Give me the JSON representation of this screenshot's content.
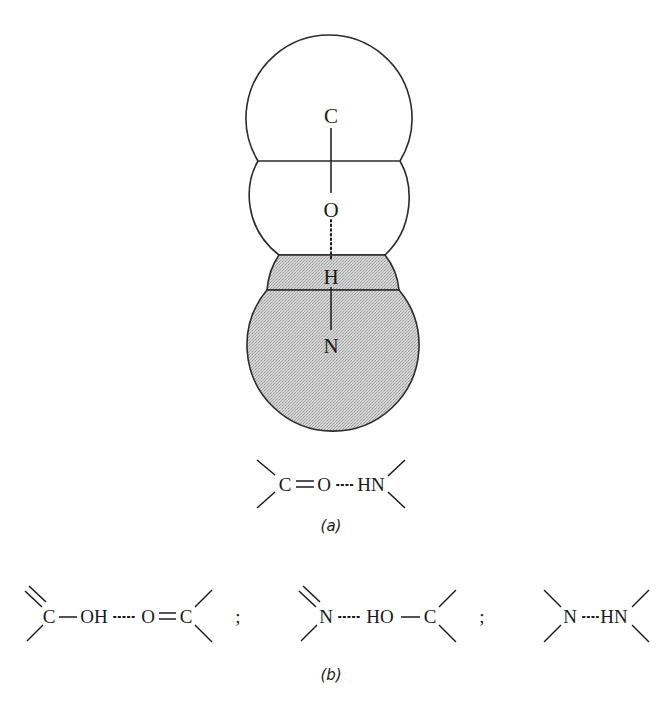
{
  "figure": {
    "header_fragment": "",
    "model": {
      "atoms": {
        "top": "C",
        "upper_middle": "O",
        "lower_middle": "H",
        "bottom": "N"
      },
      "colors": {
        "outline": "#2a2a2a",
        "shading": "#c8c8c8"
      }
    },
    "part_a": {
      "formula": {
        "c": "C",
        "o": "O",
        "hn": "HN"
      },
      "label": "(a)"
    },
    "part_b": {
      "formulas": [
        {
          "left": "C",
          "mid1": "OH",
          "mid2": "O",
          "right": "C"
        },
        {
          "left": "N",
          "mid1": "HO",
          "right": "C"
        },
        {
          "left": "N",
          "right": "HN"
        }
      ],
      "separator": ";",
      "label": "(b)"
    }
  }
}
